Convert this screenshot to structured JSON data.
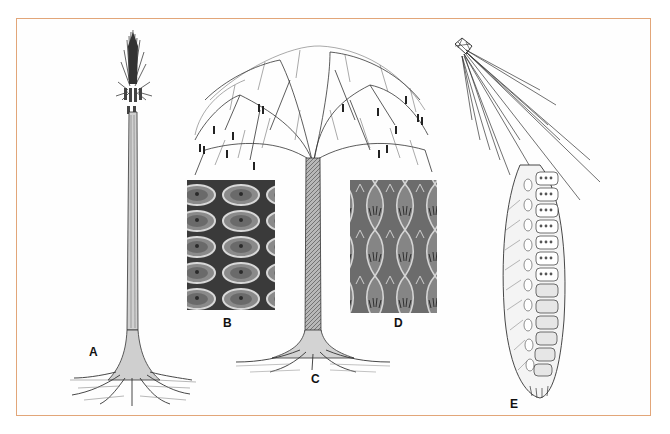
{
  "figure": {
    "border_color": "#e2a679",
    "labels": {
      "a": "A",
      "b": "B",
      "c": "C",
      "d": "D",
      "e": "E"
    },
    "panels": [
      {
        "id": "A",
        "subject": "tall unbranched tree with terminal tuft of leaves and spreading roots"
      },
      {
        "id": "B",
        "subject": "photograph of bark surface with rows of hexagonal leaf cushions"
      },
      {
        "id": "C",
        "subject": "tree with broad branching crown bearing hanging cones"
      },
      {
        "id": "D",
        "subject": "photograph of bark surface with elongated diamond-shaped leaf scars"
      },
      {
        "id": "E",
        "subject": "cone with sporangia cutaway and long strap-like leaves from apex"
      }
    ]
  }
}
